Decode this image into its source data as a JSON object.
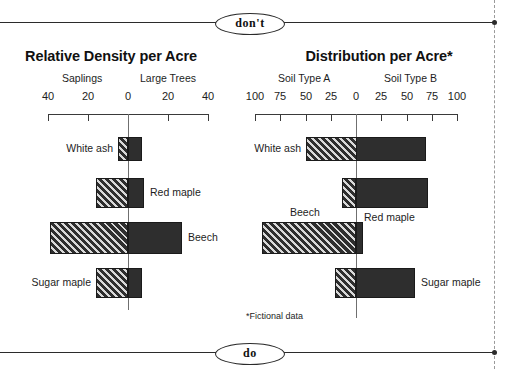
{
  "page": {
    "dont_label": "don't",
    "do_label": "do",
    "footnote": "*Fictional data"
  },
  "chart_data": [
    {
      "id": "relative-density",
      "type": "bar",
      "orientation": "horizontal-diverging",
      "title": "Relative Density per Acre",
      "xlabel": "",
      "ylabel": "",
      "left_side_label": "Saplings",
      "right_side_label": "Large Trees",
      "tick_labels": [
        "40",
        "20",
        "0",
        "20",
        "40"
      ],
      "tick_values": [
        -40,
        -20,
        0,
        20,
        40
      ],
      "xlim": [
        -40,
        40
      ],
      "grid": false,
      "legend": "none",
      "categories": [
        "White ash",
        "Red maple",
        "Beech",
        "Sugar maple"
      ],
      "series": [
        {
          "name": "Saplings",
          "values": [
            5,
            16,
            39,
            16
          ]
        },
        {
          "name": "Large Trees",
          "values": [
            7,
            8,
            27,
            7
          ]
        }
      ],
      "bars": [
        {
          "category": "White ash",
          "saplings": 5,
          "large_trees": 7,
          "label_side": "left"
        },
        {
          "category": "Red maple",
          "saplings": 16,
          "large_trees": 8,
          "label_side": "right"
        },
        {
          "category": "Beech",
          "saplings": 39,
          "large_trees": 27,
          "label_side": "right"
        },
        {
          "category": "Sugar maple",
          "saplings": 16,
          "large_trees": 7,
          "label_side": "left"
        }
      ]
    },
    {
      "id": "distribution",
      "type": "bar",
      "orientation": "horizontal-diverging",
      "title": "Distribution per Acre*",
      "xlabel": "",
      "ylabel": "",
      "left_side_label": "Soil Type A",
      "right_side_label": "Soil Type B",
      "tick_labels": [
        "100",
        "75",
        "50",
        "25",
        "0",
        "25",
        "50",
        "75",
        "100"
      ],
      "tick_values": [
        -100,
        -75,
        -50,
        -25,
        0,
        25,
        50,
        75,
        100
      ],
      "xlim": [
        -100,
        100
      ],
      "grid": false,
      "legend": "none",
      "categories": [
        "White ash",
        "Red maple",
        "Beech",
        "Sugar maple"
      ],
      "series": [
        {
          "name": "Soil Type A",
          "values": [
            50,
            14,
            93,
            21
          ]
        },
        {
          "name": "Soil Type B",
          "values": [
            69,
            71,
            7,
            58
          ]
        }
      ],
      "bars": [
        {
          "category": "White ash",
          "soil_a": 50,
          "soil_b": 69,
          "label_side": "left"
        },
        {
          "category": "Red maple",
          "soil_a": 14,
          "soil_b": 71,
          "label_side": "below-right"
        },
        {
          "category": "Beech",
          "soil_a": 93,
          "soil_b": 7,
          "label_side": "above"
        },
        {
          "category": "Sugar maple",
          "soil_a": 21,
          "soil_b": 58,
          "label_side": "right"
        }
      ]
    }
  ]
}
